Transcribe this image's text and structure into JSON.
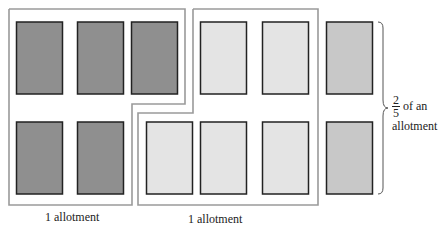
{
  "diagram": {
    "colors": {
      "dark": "#8f8f8f",
      "light": "#e4e4e4",
      "medium": "#c8c8c8",
      "outline": "#999999",
      "rect_border": "#222222"
    },
    "groups": [
      {
        "label": "1 allotment",
        "count": 5,
        "shade": "dark"
      },
      {
        "label": "1 allotment",
        "count": 5,
        "shade": "light"
      },
      {
        "label_numerator": "2",
        "label_denominator": "5",
        "label_rest": "of an",
        "label_line2": "allotment",
        "count": 2,
        "shade": "medium"
      }
    ]
  }
}
